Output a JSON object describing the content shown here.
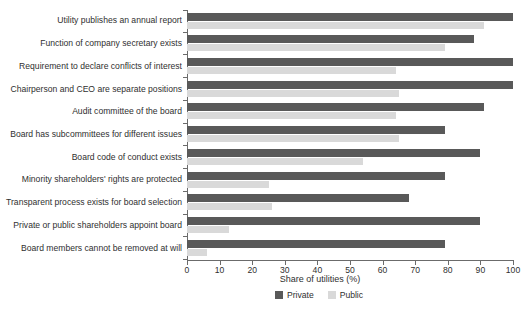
{
  "chart_data": {
    "type": "bar",
    "orientation": "horizontal",
    "title": "",
    "xlabel": "Share of utilities (%)",
    "ylabel": "",
    "xlim": [
      0,
      100
    ],
    "xticks": [
      0,
      10,
      20,
      30,
      40,
      50,
      60,
      70,
      80,
      90,
      100
    ],
    "xtick_labels": [
      "0",
      "10",
      "20",
      "30",
      "40",
      "50",
      "60",
      "70",
      "80",
      "90",
      "100"
    ],
    "grid": false,
    "legend_position": "bottom",
    "categories": [
      "Utility publishes an annual report",
      "Function of company secretary exists",
      "Requirement to declare conflicts of interest",
      "Chairperson and CEO are separate positions",
      "Audit committee of the board",
      "Board has subcommittees for different issues",
      "Board code of conduct exists",
      "Minority shareholders' rights are protected",
      "Transparent process exists for board selection",
      "Private or public shareholders appoint board",
      "Board members cannot be removed at will"
    ],
    "series": [
      {
        "name": "Private",
        "color": "#595959",
        "values": [
          100,
          88,
          100,
          100,
          91,
          79,
          90,
          79,
          68,
          90,
          79
        ]
      },
      {
        "name": "Public",
        "color": "#d9d9d9",
        "values": [
          91,
          79,
          64,
          65,
          64,
          65,
          54,
          25,
          26,
          13,
          6
        ]
      }
    ]
  },
  "colors": {
    "private": "#595959",
    "public": "#d9d9d9",
    "axis": "#6b6b6b",
    "text": "#2f2f2f",
    "background": "#ffffff"
  }
}
